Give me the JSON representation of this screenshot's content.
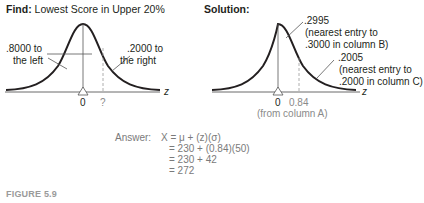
{
  "left_panel": {
    "title_bold": "Find:",
    "title_rest": " Lowest Score in Upper 20%",
    "left_area_label_1": ".8000 to",
    "left_area_label_2": "the left",
    "right_area_label_1": ".2000 to",
    "right_area_label_2": "the right",
    "mean_tick": "0",
    "unknown_tick": "?",
    "axis_label": "z"
  },
  "right_panel": {
    "title_bold": "Solution:",
    "upper_label_1": ".2995",
    "upper_label_2": "(nearest entry to",
    "upper_label_3": ".3000 in column B)",
    "tail_label_1": ".2005",
    "tail_label_2": "(nearest entry to",
    "tail_label_3": ".2000 in column C)",
    "mean_tick": "0",
    "z_tick": "0.84",
    "z_tick_note": "(from column A)",
    "axis_label": "z"
  },
  "answer": {
    "prefix": "Answer:",
    "line1": "X = μ + (z)(σ)",
    "line2": "= 230 + (0.84)(50)",
    "line3": "= 230 + 42",
    "line4": "= 272"
  },
  "caption": "FIGURE 5.9"
}
